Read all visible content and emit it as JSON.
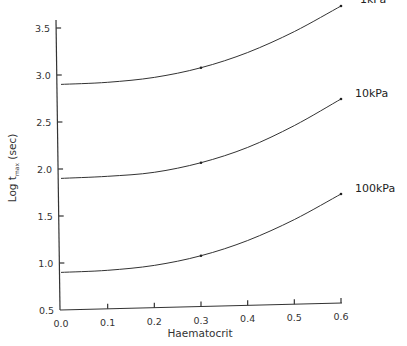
{
  "chart_data": {
    "type": "line",
    "title": "",
    "xlabel": "Haematocrit",
    "ylabel": "Log t_max (sec)",
    "ylabel_parts": {
      "prefix": "Log",
      "var": "t",
      "sub": "max",
      "unit": "(sec)"
    },
    "xlim": [
      0.0,
      0.6
    ],
    "ylim": [
      0.5,
      3.6
    ],
    "x_ticks": [
      "0.0",
      "0.1",
      "0.2",
      "0.3",
      "0.4",
      "0.5",
      "0.6"
    ],
    "y_ticks": [
      "0.5",
      "1.0",
      "1.5",
      "2.0",
      "2.5",
      "3.0",
      "3.5"
    ],
    "grid": false,
    "legend": "inline labels at right end of each curve",
    "x": [
      0.0,
      0.1,
      0.2,
      0.3,
      0.4,
      0.5,
      0.6
    ],
    "series": [
      {
        "name": "1kPa",
        "values": [
          2.9,
          2.91,
          2.95,
          3.04,
          3.19,
          3.4,
          3.66
        ],
        "markers_at": [
          0.3,
          0.6
        ]
      },
      {
        "name": "10kPa",
        "values": [
          1.9,
          1.91,
          1.94,
          2.03,
          2.18,
          2.4,
          2.67
        ],
        "markers_at": [
          0.3,
          0.6
        ]
      },
      {
        "name": "100kPa",
        "values": [
          0.9,
          0.91,
          0.95,
          1.04,
          1.19,
          1.4,
          1.66
        ],
        "markers_at": [
          0.3,
          0.6
        ]
      }
    ]
  }
}
